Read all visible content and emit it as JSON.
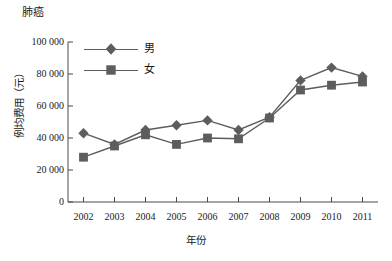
{
  "chart_data": {
    "type": "line",
    "title": "肺癌",
    "xlabel": "年份",
    "ylabel": "例均费用（元）",
    "categories": [
      "2002",
      "2003",
      "2004",
      "2005",
      "2006",
      "2007",
      "2008",
      "2009",
      "2010",
      "2011"
    ],
    "x": [
      2002,
      2003,
      2004,
      2005,
      2006,
      2007,
      2008,
      2009,
      2010,
      2011
    ],
    "xlim": [
      2001.5,
      2011.5
    ],
    "ylim": [
      0,
      100000
    ],
    "yticks": [
      0,
      20000,
      40000,
      60000,
      80000,
      100000
    ],
    "ytick_labels": [
      "0",
      "20 000",
      "40 000",
      "60 000",
      "80 000",
      "100 000"
    ],
    "grid": false,
    "legend_position": "upper-left-inside",
    "series": [
      {
        "name": "男",
        "marker": "diamond",
        "color": "#5d5d5d",
        "values": [
          43000,
          36000,
          45000,
          48000,
          51000,
          45000,
          53000,
          76000,
          84000,
          78500
        ]
      },
      {
        "name": "女",
        "marker": "square",
        "color": "#5d5d5d",
        "values": [
          28000,
          35000,
          42000,
          36000,
          40000,
          39500,
          52500,
          70000,
          73000,
          75000
        ]
      }
    ]
  },
  "axis": {
    "line_color": "#4a4a4a"
  }
}
